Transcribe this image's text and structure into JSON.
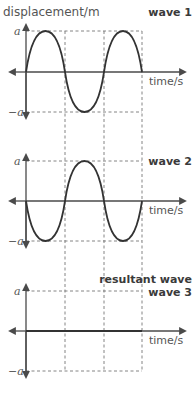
{
  "diagram": {
    "y_axis_label": "displacement/m",
    "x_axis_label": "time/s",
    "amplitude_positive": "a",
    "amplitude_negative": "−a",
    "panels": [
      {
        "id": "wave1",
        "title": "wave 1",
        "subtitle": "",
        "shape": "sine",
        "phase": "starts at 0 going up",
        "cycles": 1.5,
        "x_axis_label": "time/s"
      },
      {
        "id": "wave2",
        "title": "wave 2",
        "subtitle": "",
        "shape": "sine inverted",
        "phase": "starts at 0 going down",
        "cycles": 1.5,
        "x_axis_label": "time/s"
      },
      {
        "id": "wave3",
        "title": "resultant wave",
        "subtitle": "wave 3",
        "shape": "flat line (zero displacement)",
        "phase": "",
        "cycles": 0,
        "x_axis_label": "time/s"
      }
    ],
    "colors": {
      "curve": "#333333",
      "axis": "#4a4a4a",
      "gridline": "#777777",
      "text": "#555555"
    }
  }
}
